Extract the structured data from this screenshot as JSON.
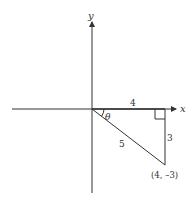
{
  "diagram": {
    "axes": {
      "x_label": "x",
      "y_label": "y"
    },
    "triangle": {
      "horizontal_side": "4",
      "vertical_side": "3",
      "hypotenuse": "5",
      "angle_label": "θ",
      "point_label": "(4, –3)"
    },
    "colors": {
      "line": "#333333",
      "background": "#ffffff"
    }
  }
}
